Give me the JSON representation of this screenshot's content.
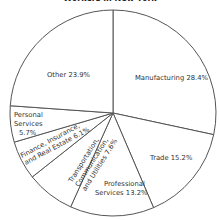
{
  "chart_data": {
    "type": "pie",
    "title": "Workers in New York",
    "start_angle_deg": 0,
    "direction": "clockwise",
    "slices": [
      {
        "label": "Manufacturing",
        "value": 28.4,
        "text": "Manufacturing 28.4%"
      },
      {
        "label": "Trade",
        "value": 15.2,
        "text": "Trade 15.2%"
      },
      {
        "label": "Professional Services",
        "value": 13.2,
        "text": "Professional Services 13.2%"
      },
      {
        "label": "Transportation, Communication, and Utilities",
        "value": 7.6,
        "text": "Transportation, Communication, and Utilities 7.6%"
      },
      {
        "label": "Finance, Insurance, and Real Estate",
        "value": 6.1,
        "text": "Finance, Insurance, and Real Estate 6.1%"
      },
      {
        "label": "Personal Services",
        "value": 5.7,
        "text": "Personal Services 5.7%"
      },
      {
        "label": "Other",
        "value": 23.9,
        "text": "Other 23.9%"
      }
    ],
    "colors": {
      "fill": "#ffffff",
      "stroke": "#555555",
      "text": "#333333"
    }
  },
  "labels": {
    "manufacturing": "Manufacturing 28.4%",
    "trade": "Trade 15.2%",
    "professional_1": "Professional",
    "professional_2": "Services 13.2%",
    "transport_1": "Transportation,",
    "transport_2": "Communication,",
    "transport_3": "and Utilities 7.6%",
    "finance_1": "Finance, Insurance,",
    "finance_2": "and Real Estate 6.1%",
    "personal_1": "Personal",
    "personal_2": "Services",
    "personal_3": "5.7%",
    "other": "Other 23.9%"
  }
}
